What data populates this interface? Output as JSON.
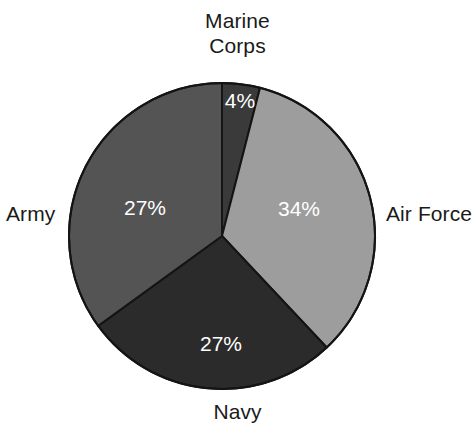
{
  "chart_data": {
    "type": "pie",
    "title": "",
    "subtitle": "",
    "xlabel": "",
    "ylabel": "",
    "legend_position": "outside-labels",
    "grid": false,
    "start_angle_deg": 0,
    "direction": "clockwise",
    "categories": [
      "Marine Corps",
      "Air Force",
      "Navy",
      "Army"
    ],
    "values": [
      4,
      34,
      27,
      27
    ],
    "value_labels": [
      "4%",
      "34%",
      "27%",
      "27%"
    ],
    "units": "percent",
    "slices": [
      {
        "name": "Marine Corps",
        "label": "Marine\nCorps",
        "value": 4,
        "value_label": "4%",
        "color": "#3a3a3a",
        "label_color": "#1a1a1a",
        "value_text_color": "#ffffff",
        "start_deg": 0,
        "end_deg": 14.4,
        "value_pos": {
          "x": 240,
          "y": 102
        }
      },
      {
        "name": "Air Force",
        "label": "Air Force",
        "value": 34,
        "value_label": "34%",
        "color": "#9d9d9d",
        "label_color": "#1a1a1a",
        "value_text_color": "#ffffff",
        "start_deg": 14.4,
        "end_deg": 136.8,
        "value_pos": {
          "x": 299,
          "y": 210
        }
      },
      {
        "name": "Navy",
        "label": "Navy",
        "value": 27,
        "value_label": "27%",
        "color": "#2b2b2b",
        "label_color": "#1a1a1a",
        "value_text_color": "#ffffff",
        "start_deg": 136.8,
        "end_deg": 234,
        "value_pos": {
          "x": 221,
          "y": 345
        }
      },
      {
        "name": "Army",
        "label": "Army",
        "value": 27,
        "value_label": "27%",
        "color": "#545454",
        "label_color": "#1a1a1a",
        "value_text_color": "#ffffff",
        "start_deg": 234,
        "end_deg": 360,
        "value_pos": {
          "x": 145,
          "y": 209
        }
      }
    ],
    "geometry": {
      "center_x": 222,
      "center_y": 236,
      "radius": 153,
      "outline_color": "#141414",
      "outline_width": 2,
      "background": "#ffffff"
    }
  },
  "labels": {
    "marine_corps": "Marine\nCorps",
    "air_force": "Air Force",
    "navy": "Navy",
    "army": "Army"
  }
}
